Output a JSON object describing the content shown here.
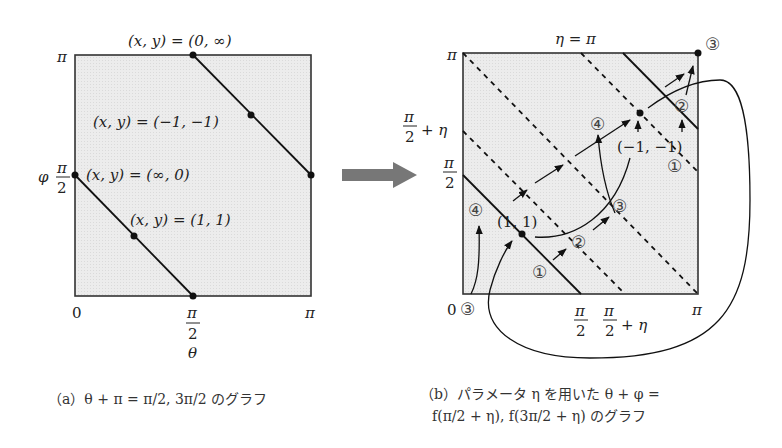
{
  "panel_a": {
    "top_point_label": "(x, y) = (0, ∞)",
    "mid_point_label": "(x, y) = (−1, −1)",
    "left_point_label": "(x, y) = (∞, 0)",
    "low_point_label": "(x, y) = (1, 1)",
    "y_axis_top": "π",
    "y_axis_var": "φ",
    "y_axis_half_num": "π",
    "y_axis_half_den": "2",
    "x_axis_zero": "0",
    "x_axis_half_num": "π",
    "x_axis_half_den": "2",
    "x_axis_var": "θ",
    "x_axis_right": "π",
    "caption": "（a）θ + π = π/2, 3π/2 のグラフ"
  },
  "panel_b": {
    "top_label": "η = π",
    "y_axis_top": "π",
    "y_axis_half_eta_num": "π",
    "y_axis_half_eta_den": "2",
    "y_axis_half_eta_suffix": "+ η",
    "y_axis_half_num": "π",
    "y_axis_half_den": "2",
    "x_axis_zero": "0",
    "x_axis_half_num": "π",
    "x_axis_half_den": "2",
    "x_axis_half_eta_num": "π",
    "x_axis_half_eta_den": "2",
    "x_axis_half_eta_suffix": "+ η",
    "x_axis_right": "π",
    "point_1_1": "(1, 1)",
    "point_m1_m1": "(−1, −1)",
    "step_markers": {
      "c1_low": "①",
      "c2_low": "②",
      "c3_mid": "③",
      "c4_left": "④",
      "c3_origin": "③",
      "c4_up": "④",
      "c1_right": "①",
      "c2_right": "②",
      "c3_corner": "③"
    },
    "caption_line1": "（b）パラメータ η を用いた θ + φ =",
    "caption_line2": "f(π/2 + η), f(3π/2 + η) のグラフ"
  }
}
